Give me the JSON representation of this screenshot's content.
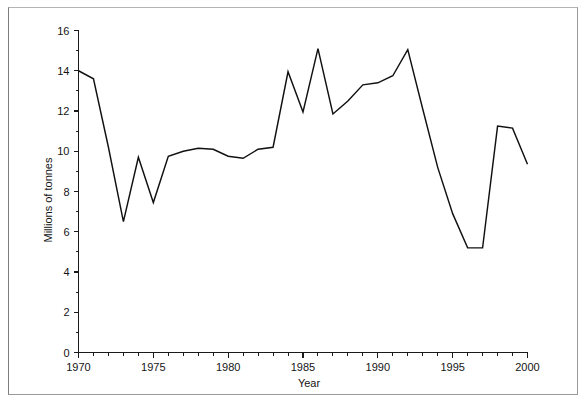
{
  "chart_data": {
    "type": "line",
    "title": "",
    "subtitle": "",
    "xlabel": "Year",
    "ylabel": "Millions of tonnes",
    "xlim": [
      1970,
      2000
    ],
    "ylim": [
      0,
      16
    ],
    "grid": false,
    "legend": null,
    "x_major_ticks": [
      1970,
      1975,
      1980,
      1985,
      1990,
      1995,
      2000
    ],
    "x_major_tick_labels": [
      "1970",
      "1975",
      "1980",
      "1985",
      "1990",
      "1995",
      "2000"
    ],
    "x_minor_tick_step": 1,
    "y_major_ticks": [
      0,
      2,
      4,
      6,
      8,
      10,
      12,
      14,
      16
    ],
    "y_major_tick_labels": [
      "0",
      "2",
      "4",
      "6",
      "8",
      "10",
      "12",
      "14",
      "16"
    ],
    "y_minor_tick_step": 1,
    "series": [
      {
        "name": "Millions of tonnes",
        "color": "#111111",
        "x": [
          1970,
          1971,
          1972,
          1973,
          1974,
          1975,
          1976,
          1977,
          1978,
          1979,
          1980,
          1981,
          1982,
          1983,
          1984,
          1985,
          1986,
          1987,
          1988,
          1989,
          1990,
          1991,
          1992,
          1993,
          1994,
          1995,
          1996,
          1997,
          1998,
          1999,
          2000
        ],
        "values": [
          14.0,
          13.6,
          10.2,
          6.5,
          9.7,
          7.45,
          9.75,
          10.0,
          10.15,
          10.1,
          9.75,
          9.65,
          10.1,
          10.2,
          13.95,
          11.95,
          15.1,
          11.85,
          12.5,
          13.3,
          13.4,
          13.75,
          15.05,
          12.1,
          9.2,
          6.9,
          5.2,
          5.2,
          11.25,
          11.15,
          9.35
        ]
      }
    ],
    "annotations": []
  },
  "figure": {
    "frame_color": "#9a9a9a",
    "background": "#ffffff",
    "axis_color": "#1a1a1a",
    "line_color": "#111111"
  }
}
